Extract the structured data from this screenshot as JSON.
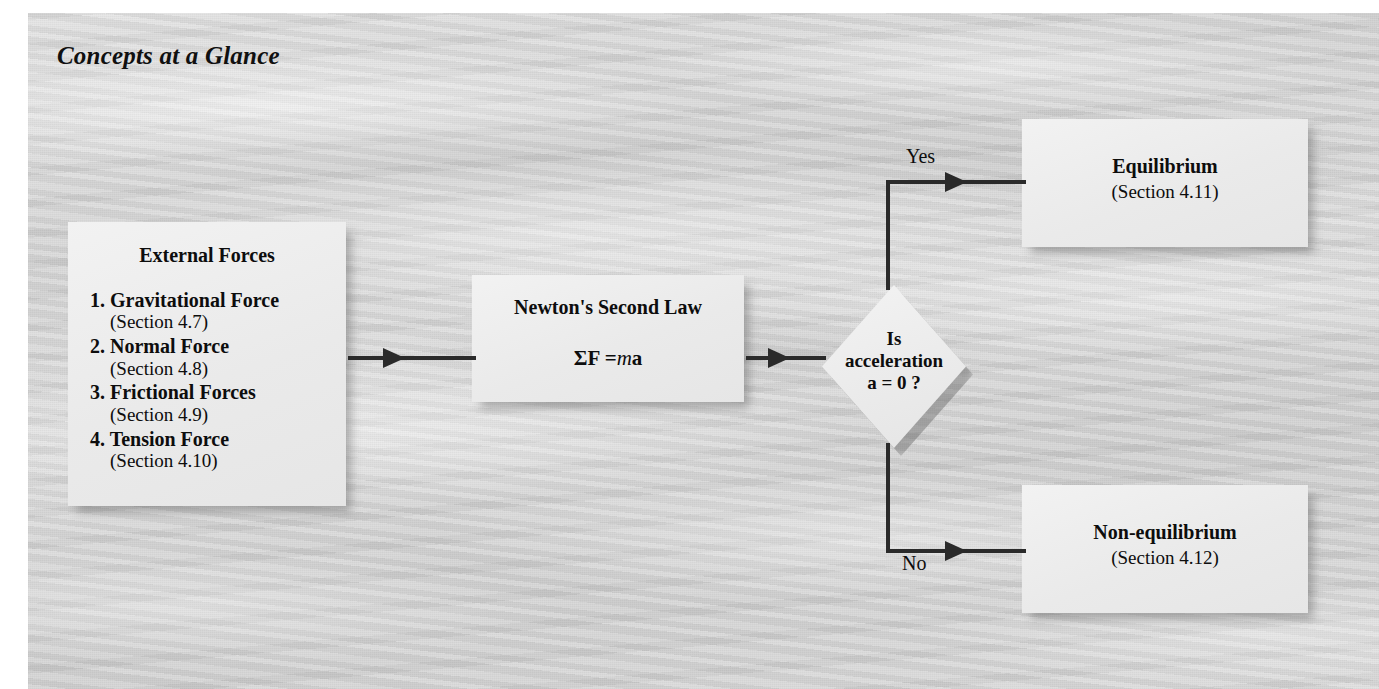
{
  "figure": {
    "title": "Concepts at a Glance",
    "type": "flowchart"
  },
  "nodes": {
    "external_forces": {
      "heading": "External Forces",
      "items": [
        {
          "number": "1.",
          "name": "Gravitational Force",
          "section": "(Section 4.7)"
        },
        {
          "number": "2.",
          "name": "Normal Force",
          "section": "(Section 4.8)"
        },
        {
          "number": "3.",
          "name": "Frictional Forces",
          "section": "(Section 4.9)"
        },
        {
          "number": "4.",
          "name": "Tension Force",
          "section": "(Section 4.10)"
        }
      ]
    },
    "newton": {
      "title": "Newton's Second Law",
      "equation_sigma_f": "ΣF =",
      "equation_m": "m",
      "equation_a": "a"
    },
    "decision": {
      "line1": "Is",
      "line2": "acceleration",
      "line3": "a = 0 ?"
    },
    "equilibrium": {
      "title": "Equilibrium",
      "section": "(Section 4.11)"
    },
    "nonequilibrium": {
      "title": "Non-equilibrium",
      "section": "(Section 4.12)"
    }
  },
  "edges": {
    "yes_label": "Yes",
    "no_label": "No"
  },
  "colors": {
    "background_paper": "#d2d2d2",
    "node_fill": "#ececec",
    "line": "#2a2a2a",
    "text": "#0d0d0d"
  }
}
